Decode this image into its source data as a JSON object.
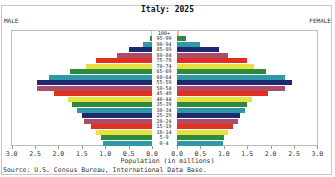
{
  "chart_data": {
    "type": "bar",
    "subtype": "population-pyramid",
    "title": "Italy: 2025",
    "left_label": "MALE",
    "right_label": "FEMALE",
    "xlabel": "Population (in millions)",
    "source": "Source: U.S. Census Bureau, International Data Base.",
    "x_ticks_left": [
      "3.0",
      "2.5",
      "2.0",
      "1.5",
      "1.0",
      "0.5",
      "0.0"
    ],
    "x_ticks_right": [
      "0.0",
      "0.5",
      "1.0",
      "1.5",
      "2.0",
      "2.5",
      "3.0"
    ],
    "xlim": [
      0,
      3.0
    ],
    "categories": [
      "100+",
      "95-99",
      "90-94",
      "85-89",
      "80-84",
      "75-79",
      "70-74",
      "65-69",
      "60-64",
      "55-59",
      "50-54",
      "45-49",
      "40-44",
      "35-39",
      "30-34",
      "25-29",
      "20-24",
      "15-19",
      "10-14",
      "5-9",
      "0-4"
    ],
    "series": [
      {
        "name": "Male",
        "values": [
          0.02,
          0.05,
          0.2,
          0.5,
          0.75,
          1.2,
          1.4,
          1.75,
          2.2,
          2.45,
          2.45,
          2.1,
          1.8,
          1.7,
          1.6,
          1.5,
          1.45,
          1.3,
          1.2,
          1.1,
          1.05
        ]
      },
      {
        "name": "Female",
        "values": [
          0.05,
          0.2,
          0.5,
          0.9,
          1.1,
          1.5,
          1.65,
          1.9,
          2.3,
          2.45,
          2.3,
          1.95,
          1.6,
          1.5,
          1.45,
          1.35,
          1.3,
          1.2,
          1.1,
          1.0,
          0.98
        ]
      }
    ],
    "colors": [
      "#d8c87a",
      "#2e8b3e",
      "#2f9aa6",
      "#1e2a6e",
      "#b04a6a",
      "#e0301e",
      "#e8e040",
      "#2e8b3e",
      "#2f9aa6",
      "#1e2a6e",
      "#b04a6a",
      "#e0301e",
      "#e8e040",
      "#2e8b3e",
      "#2f9aa6",
      "#1e2a6e",
      "#b04a6a",
      "#e0301e",
      "#e8e040",
      "#2e8b3e",
      "#2f9aa6"
    ],
    "grid": false
  }
}
